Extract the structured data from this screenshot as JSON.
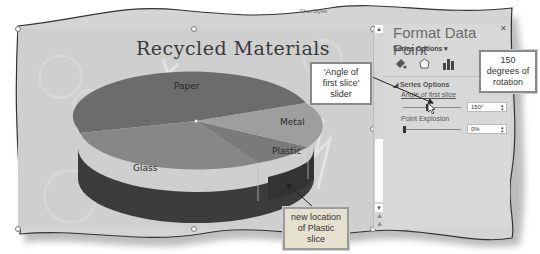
{
  "ribbon": {
    "hint_text": "Chart Styles"
  },
  "chart": {
    "title": "Recycled Materials",
    "slices": [
      {
        "label": "Paper",
        "color": "#6c6c6c"
      },
      {
        "label": "Metal",
        "color": "#9c9c9c"
      },
      {
        "label": "Plastic",
        "color": "#7e7e7e"
      },
      {
        "label": "Glass",
        "color": "#8a8a8a"
      }
    ]
  },
  "pane": {
    "title": "Format Data Point",
    "series_options_dropdown": "Series Options",
    "tabs": [
      {
        "icon": "fill-line-icon"
      },
      {
        "icon": "effects-icon"
      },
      {
        "icon": "series-options-icon"
      }
    ],
    "section_header": "Series Options",
    "angle_label": "Angle of first slice",
    "angle_value": "150°",
    "explosion_label": "Point Explosion",
    "explosion_value": "0%"
  },
  "callouts": {
    "angle_slider": "'Angle of first slice' slider",
    "rotation": "150 degrees of rotation",
    "plastic": "new location of Plastic slice"
  },
  "colors": {
    "chart_bg": "#cfcfcf",
    "pane_bg": "#d8d8d8",
    "pie_side": "#3c3c3c"
  }
}
